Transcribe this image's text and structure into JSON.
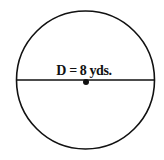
{
  "diagram": {
    "shape": "circle",
    "label": "D = 8 yds.",
    "label_parts": {
      "symbol": "D",
      "equals": "=",
      "value": "8",
      "unit": "yds."
    },
    "elements": [
      "circle-outline",
      "diameter-line",
      "center-point"
    ],
    "colors": {
      "stroke": "#111111",
      "background": "#ffffff"
    }
  }
}
